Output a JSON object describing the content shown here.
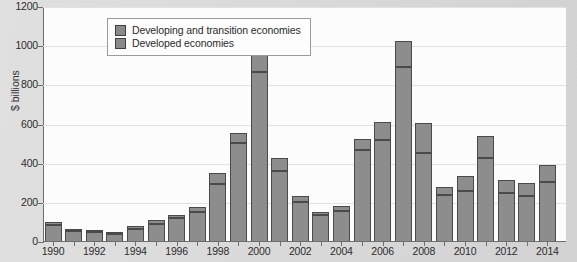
{
  "chart_data": {
    "type": "bar",
    "title": "",
    "subtitle": "",
    "xlabel": "",
    "ylabel": "$ billions",
    "ylim": [
      0,
      1200
    ],
    "yticks": [
      0,
      200,
      400,
      600,
      800,
      1000,
      1200
    ],
    "grid": true,
    "stacked": true,
    "legend_position": "top-left",
    "categories": [
      "1990",
      "1991",
      "1992",
      "1993",
      "1994",
      "1995",
      "1996",
      "1997",
      "1998",
      "1999",
      "2000",
      "2001",
      "2002",
      "2003",
      "2004",
      "2005",
      "2006",
      "2007",
      "2008",
      "2009",
      "2010",
      "2011",
      "2012",
      "2013",
      "2014"
    ],
    "xtick_labels": [
      "1990",
      "1992",
      "1994",
      "1996",
      "1998",
      "2000",
      "2002",
      "2004",
      "2006",
      "2008",
      "2010",
      "2012",
      "2014"
    ],
    "series": [
      {
        "name": "Developed economies",
        "color": "#8d8d8d",
        "values": [
          80,
          50,
          45,
          35,
          60,
          85,
          115,
          150,
          290,
          500,
          865,
          360,
          200,
          135,
          155,
          465,
          515,
          890,
          450,
          235,
          255,
          425,
          245,
          230,
          300
        ]
      },
      {
        "name": "Developing and transition economies",
        "color": "#8d8d8d",
        "values": [
          15,
          10,
          10,
          10,
          15,
          20,
          20,
          25,
          55,
          50,
          90,
          65,
          30,
          15,
          25,
          55,
          95,
          130,
          155,
          40,
          75,
          110,
          65,
          65,
          90
        ]
      }
    ],
    "totals": [
      95,
      60,
      55,
      45,
      75,
      105,
      135,
      175,
      345,
      550,
      955,
      425,
      230,
      150,
      180,
      520,
      610,
      1020,
      605,
      275,
      330,
      535,
      310,
      295,
      390
    ]
  },
  "legend": {
    "items": [
      {
        "label": "Developing and transition economies",
        "swatch": "#8a8a8a"
      },
      {
        "label": "Developed economies",
        "swatch": "#8a8a8a"
      }
    ]
  }
}
